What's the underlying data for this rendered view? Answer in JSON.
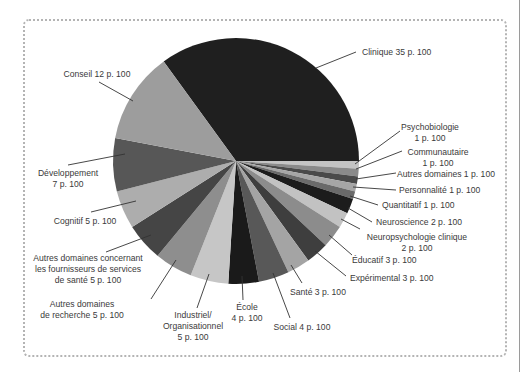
{
  "chart_data": {
    "type": "pie",
    "title": "",
    "start_angle_deg": -36,
    "direction": "clockwise",
    "unit": "p. 100",
    "slices": [
      {
        "label": "Clinique",
        "value": 35,
        "color": "#1f1f1f",
        "text": [
          "Clinique 35 p. 100"
        ]
      },
      {
        "label": "Psychobiologie",
        "value": 1,
        "color": "#c4c4c4",
        "text": [
          "Psychobiologie",
          "1 p. 100"
        ]
      },
      {
        "label": "Communautaire",
        "value": 1,
        "color": "#8a8a8a",
        "text": [
          "Communautaire",
          "1 p. 100"
        ]
      },
      {
        "label": "Autres domaines",
        "value": 1,
        "color": "#4a4a4a",
        "text": [
          "Autres domaines 1 p. 100"
        ]
      },
      {
        "label": "Personnalité",
        "value": 1,
        "color": "#a6a6a6",
        "text": [
          "Personnalité 1 p. 100"
        ]
      },
      {
        "label": "Quantitatif",
        "value": 1,
        "color": "#6a6a6a",
        "text": [
          "Quantitatif 1 p. 100"
        ]
      },
      {
        "label": "Neuroscience",
        "value": 2,
        "color": "#1c1c1c",
        "text": [
          "Neuroscience 2 p. 100"
        ]
      },
      {
        "label": "Neuropsychologie clinique",
        "value": 2,
        "color": "#c2c2c2",
        "text": [
          "Neuropsychologie clinique",
          "2 p. 100"
        ]
      },
      {
        "label": "Éducatif",
        "value": 3,
        "color": "#8c8c8c",
        "text": [
          "Éducatif 3 p. 100"
        ]
      },
      {
        "label": "Expérimental",
        "value": 3,
        "color": "#3e3e3e",
        "text": [
          "Expérimental 3 p. 100"
        ]
      },
      {
        "label": "Santé",
        "value": 3,
        "color": "#a4a4a4",
        "text": [
          "Santé 3 p. 100"
        ]
      },
      {
        "label": "Social",
        "value": 4,
        "color": "#585858",
        "text": [
          "Social 4 p. 100"
        ]
      },
      {
        "label": "École",
        "value": 4,
        "color": "#1a1a1a",
        "text": [
          "École",
          "4 p. 100"
        ]
      },
      {
        "label": "Industriel/Organisationnel",
        "value": 5,
        "color": "#c6c6c6",
        "text": [
          "Industriel/",
          "Organisationnel",
          "5 p. 100"
        ]
      },
      {
        "label": "Autres domaines de recherche",
        "value": 5,
        "color": "#8e8e8e",
        "text": [
          "Autres domaines",
          "de recherche 5 p. 100"
        ]
      },
      {
        "label": "Autres domaines concernant les fournisseurs de services de santé",
        "value": 5,
        "color": "#454545",
        "text": [
          "Autres domaines concernant",
          "les fournisseurs de services",
          "de santé 5 p. 100"
        ]
      },
      {
        "label": "Cognitif",
        "value": 5,
        "color": "#adadad",
        "text": [
          "Cognitif 5 p. 100"
        ]
      },
      {
        "label": "Développement",
        "value": 7,
        "color": "#575757",
        "text": [
          "Développement",
          "7 p. 100"
        ]
      },
      {
        "label": "Conseil",
        "value": 12,
        "color": "#9d9d9d",
        "text": [
          "Conseil 12 p. 100"
        ]
      }
    ],
    "legend": "none (leader-line labels)"
  },
  "layout": {
    "center": [
      236,
      161
    ],
    "radius": 123,
    "labels": [
      {
        "x": 362,
        "y": 55,
        "anchor": "start",
        "leader": [
          [
            316,
            68
          ],
          [
            356,
            52
          ]
        ]
      },
      {
        "x": 430,
        "y": 130,
        "anchor": "middle",
        "leader": [
          [
            355,
            164
          ],
          [
            400,
            131
          ]
        ]
      },
      {
        "x": 438,
        "y": 155,
        "anchor": "middle",
        "leader": [
          [
            356,
            169
          ],
          [
            402,
            151
          ]
        ]
      },
      {
        "x": 397,
        "y": 177,
        "anchor": "start",
        "leader": [
          [
            356,
            179
          ],
          [
            396,
            173
          ]
        ]
      },
      {
        "x": 399,
        "y": 193,
        "anchor": "start",
        "leader": [
          [
            353,
            187
          ],
          [
            396,
            190
          ]
        ]
      },
      {
        "x": 382,
        "y": 208,
        "anchor": "start",
        "leader": [
          [
            350,
            196
          ],
          [
            378,
            205
          ]
        ]
      },
      {
        "x": 376,
        "y": 225,
        "anchor": "start",
        "leader": [
          [
            348,
            208
          ],
          [
            372,
            222
          ]
        ]
      },
      {
        "x": 417,
        "y": 240,
        "anchor": "middle",
        "leader": [
          [
            341,
            219
          ],
          [
            360,
            229
          ]
        ]
      },
      {
        "x": 352,
        "y": 263,
        "anchor": "start",
        "leader": [
          [
            329,
            235
          ],
          [
            352,
            255
          ]
        ]
      },
      {
        "x": 350,
        "y": 281,
        "anchor": "start",
        "leader": [
          [
            315,
            251
          ],
          [
            346,
            276
          ]
        ]
      },
      {
        "x": 290,
        "y": 295,
        "anchor": "start",
        "leader": [
          [
            291,
            265
          ],
          [
            302,
            283
          ]
        ]
      },
      {
        "x": 302,
        "y": 330,
        "anchor": "middle",
        "leader": [
          [
            273,
            273
          ],
          [
            290,
            318
          ]
        ]
      },
      {
        "x": 247,
        "y": 310,
        "anchor": "middle",
        "leader": [
          [
            242,
            276
          ],
          [
            243,
            300
          ]
        ]
      },
      {
        "x": 193,
        "y": 318,
        "anchor": "middle",
        "leader": [
          [
            209,
            274
          ],
          [
            197,
            308
          ]
        ]
      },
      {
        "x": 82,
        "y": 307,
        "anchor": "middle",
        "leader": [
          [
            176,
            260
          ],
          [
            151,
            299
          ]
        ]
      },
      {
        "x": 88,
        "y": 261,
        "anchor": "middle",
        "leader": [
          [
            151,
            235
          ],
          [
            106,
            252
          ]
        ]
      },
      {
        "x": 85,
        "y": 224,
        "anchor": "middle",
        "leader": [
          [
            136,
            201
          ],
          [
            91,
            212
          ]
        ]
      },
      {
        "x": 68,
        "y": 176,
        "anchor": "middle",
        "leader": [
          [
            125,
            154
          ],
          [
            68,
            165
          ]
        ]
      },
      {
        "x": 97,
        "y": 77,
        "anchor": "middle",
        "leader": [
          [
            133,
            101
          ],
          [
            99,
            82
          ]
        ]
      }
    ]
  }
}
